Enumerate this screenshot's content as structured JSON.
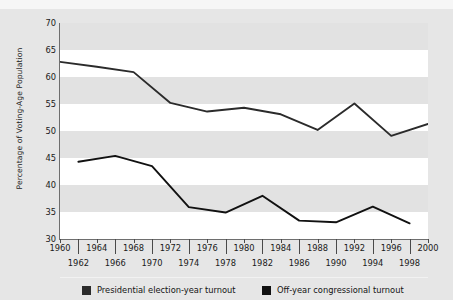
{
  "chart_data": {
    "type": "line",
    "title": "",
    "xlabel": "",
    "ylabel": "Percentage of Voting-Age Population",
    "ylim": [
      30,
      70
    ],
    "yticks": [
      30,
      35,
      40,
      45,
      50,
      55,
      60,
      65,
      70
    ],
    "xlim": [
      1960,
      2000
    ],
    "xticks": [
      1960,
      1962,
      1964,
      1966,
      1968,
      1970,
      1972,
      1974,
      1976,
      1978,
      1980,
      1982,
      1984,
      1986,
      1988,
      1990,
      1992,
      1994,
      1996,
      1998,
      2000
    ],
    "xticks_upper_row": [
      1960,
      1964,
      1968,
      1972,
      1976,
      1980,
      1984,
      1988,
      1992,
      1996,
      2000
    ],
    "xticks_lower_row": [
      1962,
      1966,
      1970,
      1974,
      1978,
      1982,
      1986,
      1990,
      1994,
      1998
    ],
    "grid": "horizontal-bands",
    "legend_position": "bottom",
    "series": [
      {
        "name": "Presidential election-year turnout",
        "color": "#2b2b2b",
        "x": [
          1960,
          1964,
          1968,
          1972,
          1976,
          1980,
          1984,
          1988,
          1992,
          1996,
          2000
        ],
        "values": [
          62.8,
          61.9,
          60.9,
          55.2,
          53.6,
          54.3,
          53.1,
          50.2,
          55.1,
          49.1,
          51.3
        ]
      },
      {
        "name": "Off-year congressional turnout",
        "color": "#111111",
        "x": [
          1962,
          1966,
          1970,
          1974,
          1978,
          1982,
          1986,
          1990,
          1994,
          1998
        ],
        "values": [
          44.3,
          45.4,
          43.5,
          35.9,
          34.9,
          38.0,
          33.4,
          33.1,
          36.0,
          32.9
        ]
      }
    ]
  },
  "axis": {
    "ylabel": "Percentage of Voting-Age Population"
  },
  "legend": {
    "items": [
      {
        "label": "Presidential election-year turnout",
        "color": "#2b2b2b"
      },
      {
        "label": "Off-year congressional turnout",
        "color": "#111111"
      }
    ]
  }
}
